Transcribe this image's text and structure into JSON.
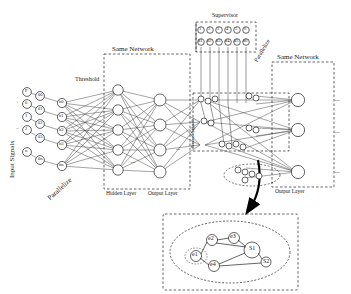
{
  "figure": {
    "labels": {
      "input_signals": "Input Signals",
      "threshold": "Threshold",
      "parallel_left": "Parallelize",
      "parallel_right": "Parallelize",
      "same_network_1": "Same Network",
      "same_network_2": "Same Network",
      "hidden_layer": "Hidden Layer",
      "output_layer_1": "Output Layer",
      "output_layer_2": "Output Layer",
      "supervisor": "Supervisor",
      "neural_signals": "Neural Signals",
      "dots_h": "· · ·",
      "ellipsis": "..."
    },
    "input_nodes": [
      "P",
      "0",
      "1",
      "2",
      "3",
      "4",
      "n"
    ],
    "input_extra_symbols": [
      "+",
      "−"
    ],
    "threshold_nodes": [
      "θ0",
      "θ1",
      "θ2",
      "θ3",
      "θn"
    ],
    "hidden_nodes": [
      "h0",
      "h1",
      "h2",
      "h3",
      "hn"
    ],
    "output_nodes": [
      "o0",
      "o1",
      "o2",
      "on"
    ],
    "supervisor_row_top": [
      "1",
      "2",
      "3",
      "4",
      "5",
      "6"
    ],
    "supervisor_row_mid": [
      "d1",
      "d2",
      "d3",
      "d4",
      "d5",
      "d6"
    ],
    "supervisor_group_label": "Supervisor",
    "inset": {
      "nodes": [
        "e1",
        "e2",
        "e3",
        "e4",
        "S1",
        "S2"
      ],
      "caption": ""
    },
    "colors": {
      "stroke": "#222222",
      "node_fill": "#ffffff",
      "box_dash": "#222222",
      "arrow": "#000000"
    }
  }
}
